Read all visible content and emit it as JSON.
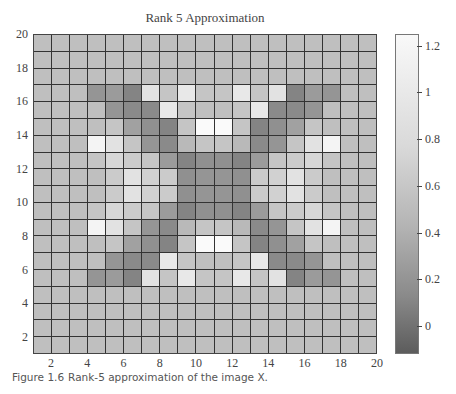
{
  "title": "Rank 5 Approximation",
  "caption": {
    "label": "Figure 1.6",
    "text": "Rank-5 approximation of the image X."
  },
  "chart_data": {
    "type": "heatmap",
    "title": "Rank 5 Approximation",
    "xlabel": "",
    "ylabel": "",
    "xlim": [
      1,
      20
    ],
    "ylim": [
      1,
      20
    ],
    "x_ticks": [
      2,
      4,
      6,
      8,
      10,
      12,
      14,
      16,
      18,
      20
    ],
    "y_ticks": [
      2,
      4,
      6,
      8,
      10,
      12,
      14,
      16,
      18,
      20
    ],
    "grid": true,
    "colormap": "gray",
    "colorbar": {
      "range": [
        -0.12,
        1.25
      ],
      "ticks": [
        0,
        0.2,
        0.4,
        0.6,
        0.8,
        1,
        1.2
      ],
      "tick_labels": [
        "0",
        "0.2",
        "0.4",
        "0.6",
        "0.8",
        "1",
        "1.2"
      ]
    },
    "rows_top_to_bottom_note": "row 0 = y in [19,20], columns left to right x in [1,2]..[19,20]",
    "values": [
      [
        0.75,
        0.75,
        0.75,
        0.75,
        0.75,
        0.75,
        0.75,
        0.75,
        0.75,
        0.75,
        0.75,
        0.75,
        0.75,
        0.75,
        0.75,
        0.75,
        0.75,
        0.75,
        0.75
      ],
      [
        0.75,
        0.75,
        0.75,
        0.75,
        0.75,
        0.75,
        0.75,
        0.75,
        0.75,
        0.75,
        0.75,
        0.75,
        0.75,
        0.75,
        0.75,
        0.75,
        0.75,
        0.75,
        0.75
      ],
      [
        0.75,
        0.75,
        0.75,
        0.75,
        0.75,
        0.75,
        0.75,
        0.75,
        0.75,
        0.75,
        0.75,
        0.75,
        0.75,
        0.75,
        0.75,
        0.75,
        0.75,
        0.75,
        0.75
      ],
      [
        0.75,
        0.75,
        0.75,
        0.4,
        0.45,
        0.25,
        1.05,
        0.8,
        1.1,
        0.8,
        0.8,
        1.1,
        0.8,
        1.05,
        0.25,
        0.45,
        0.4,
        0.75,
        0.75
      ],
      [
        0.75,
        0.75,
        0.75,
        0.75,
        0.4,
        0.3,
        0.3,
        1.1,
        0.8,
        0.75,
        0.75,
        0.8,
        1.1,
        0.3,
        0.3,
        0.4,
        0.75,
        0.75,
        0.75
      ],
      [
        0.75,
        0.75,
        0.75,
        0.75,
        0.8,
        0.5,
        0.35,
        0.25,
        0.8,
        1.25,
        1.25,
        0.8,
        0.25,
        0.35,
        0.5,
        0.8,
        0.75,
        0.75,
        0.75
      ],
      [
        0.75,
        0.75,
        0.75,
        1.2,
        1.05,
        0.8,
        0.4,
        0.3,
        0.7,
        0.8,
        0.8,
        0.7,
        0.3,
        0.4,
        0.8,
        1.05,
        1.2,
        0.75,
        0.75
      ],
      [
        0.75,
        0.75,
        0.75,
        0.8,
        0.95,
        0.85,
        0.8,
        0.45,
        0.25,
        0.35,
        0.35,
        0.25,
        0.45,
        0.8,
        0.85,
        0.95,
        0.8,
        0.75,
        0.75
      ],
      [
        0.75,
        0.75,
        0.75,
        0.75,
        0.85,
        1.05,
        0.9,
        0.85,
        0.35,
        0.4,
        0.4,
        0.35,
        0.85,
        0.9,
        1.05,
        0.85,
        0.75,
        0.75,
        0.75
      ],
      [
        0.75,
        0.75,
        0.75,
        0.75,
        0.85,
        1.05,
        0.9,
        0.85,
        0.35,
        0.4,
        0.4,
        0.35,
        0.85,
        0.9,
        1.05,
        0.85,
        0.75,
        0.75,
        0.75
      ],
      [
        0.75,
        0.75,
        0.75,
        0.8,
        0.95,
        0.85,
        0.8,
        0.45,
        0.25,
        0.35,
        0.35,
        0.25,
        0.45,
        0.8,
        0.85,
        0.95,
        0.8,
        0.75,
        0.75
      ],
      [
        0.75,
        0.75,
        0.75,
        1.2,
        1.05,
        0.8,
        0.4,
        0.3,
        0.7,
        0.8,
        0.8,
        0.7,
        0.3,
        0.4,
        0.8,
        1.05,
        1.2,
        0.75,
        0.75
      ],
      [
        0.75,
        0.75,
        0.75,
        0.75,
        0.8,
        0.5,
        0.35,
        0.25,
        0.8,
        1.25,
        1.25,
        0.8,
        0.25,
        0.35,
        0.5,
        0.8,
        0.75,
        0.75,
        0.75
      ],
      [
        0.75,
        0.75,
        0.75,
        0.75,
        0.4,
        0.3,
        0.3,
        1.1,
        0.8,
        0.75,
        0.75,
        0.8,
        1.1,
        0.3,
        0.3,
        0.4,
        0.75,
        0.75,
        0.75
      ],
      [
        0.75,
        0.75,
        0.75,
        0.4,
        0.45,
        0.25,
        1.05,
        0.8,
        1.1,
        0.8,
        0.8,
        1.1,
        0.8,
        1.05,
        0.25,
        0.45,
        0.4,
        0.75,
        0.75
      ],
      [
        0.75,
        0.75,
        0.75,
        0.75,
        0.75,
        0.75,
        0.75,
        0.75,
        0.75,
        0.75,
        0.75,
        0.75,
        0.75,
        0.75,
        0.75,
        0.75,
        0.75,
        0.75,
        0.75
      ],
      [
        0.75,
        0.75,
        0.75,
        0.75,
        0.75,
        0.75,
        0.75,
        0.75,
        0.75,
        0.75,
        0.75,
        0.75,
        0.75,
        0.75,
        0.75,
        0.75,
        0.75,
        0.75,
        0.75
      ],
      [
        0.75,
        0.75,
        0.75,
        0.75,
        0.75,
        0.75,
        0.75,
        0.75,
        0.75,
        0.75,
        0.75,
        0.75,
        0.75,
        0.75,
        0.75,
        0.75,
        0.75,
        0.75,
        0.75
      ],
      [
        0.75,
        0.75,
        0.75,
        0.75,
        0.75,
        0.75,
        0.75,
        0.75,
        0.75,
        0.75,
        0.75,
        0.75,
        0.75,
        0.75,
        0.75,
        0.75,
        0.75,
        0.75,
        0.75
      ]
    ]
  }
}
